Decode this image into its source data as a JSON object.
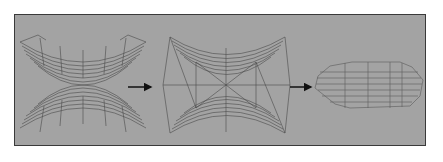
{
  "diagram": {
    "type": "mesh-stitching-sequence",
    "colors": {
      "background": "#a3a3a3",
      "border": "#3a3a3a",
      "mesh": "#4a4a4a",
      "arrow": "#111111"
    },
    "stages": [
      {
        "name": "two-separate-curved-meshes"
      },
      {
        "name": "meshes-connected-by-triangulation"
      },
      {
        "name": "merged-collapsed-mesh"
      }
    ],
    "arrows": 2
  }
}
